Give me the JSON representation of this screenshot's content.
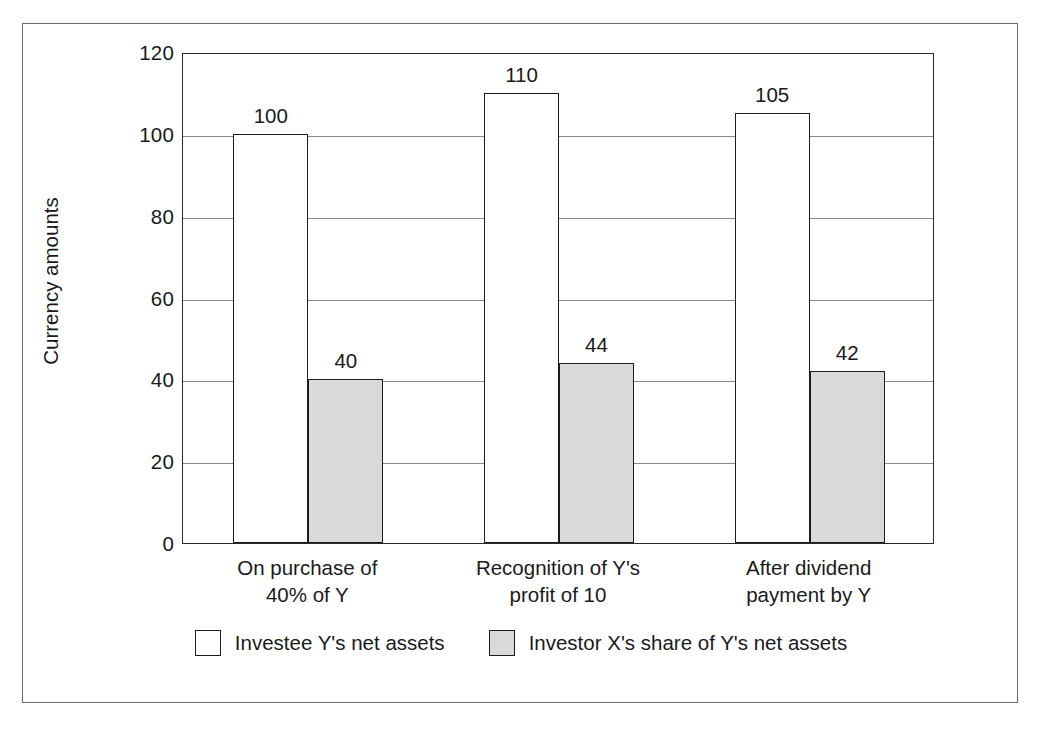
{
  "chart_data": {
    "type": "bar",
    "title": "",
    "xlabel": "",
    "ylabel": "Currency amounts",
    "ylim": [
      0,
      120
    ],
    "yticks": [
      0,
      20,
      40,
      60,
      80,
      100,
      120
    ],
    "ytick_labels": [
      "0",
      "20",
      "40",
      "60",
      "80",
      "100",
      "120"
    ],
    "grid": true,
    "legend_position": "bottom",
    "categories": [
      "On purchase of\n40% of Y",
      "Recognition of Y's\nprofit of 10",
      "After dividend\npayment by Y"
    ],
    "category_lines": [
      [
        "On purchase of",
        "40% of Y"
      ],
      [
        "Recognition of Y's",
        "profit of 10"
      ],
      [
        "After dividend",
        "payment by Y"
      ]
    ],
    "series": [
      {
        "name": "Investee Y's net assets",
        "values": [
          100,
          110,
          105
        ],
        "value_labels": [
          "100",
          "110",
          "105"
        ],
        "fill": "#ffffff",
        "edge": "#1c1c1c"
      },
      {
        "name": "Investor X's share of Y's net assets",
        "values": [
          40,
          44,
          42
        ],
        "value_labels": [
          "40",
          "44",
          "42"
        ],
        "fill": "#d9d9d9",
        "edge": "#1c1c1c"
      }
    ]
  },
  "legend": {
    "items": [
      {
        "label": "Investee Y's net assets",
        "swatch": "white"
      },
      {
        "label": "Investor X's share of Y's net assets",
        "swatch": "gray"
      }
    ]
  },
  "colors": {
    "frame": "#6e6e6e",
    "axis": "#2b2b2b",
    "gridline": "#8c8c8c",
    "bar_white_fill": "#ffffff",
    "bar_gray_fill": "#d9d9d9",
    "bar_edge": "#1c1c1c",
    "text": "#1a1a1a"
  }
}
